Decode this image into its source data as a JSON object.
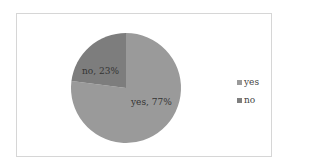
{
  "chart_data": {
    "type": "pie",
    "title": "",
    "categories": [
      "yes",
      "no"
    ],
    "values": [
      77,
      23
    ],
    "unit": "%",
    "data_labels": [
      "yes, 77%",
      "no, 23%"
    ],
    "colors": {
      "yes": "#9a9a9a",
      "no": "#7d7d7d"
    },
    "legend": {
      "position": "right",
      "entries": [
        "yes",
        "no"
      ]
    }
  },
  "labels": {
    "yes": "yes, 77%",
    "no": "no, 23%"
  },
  "legend": {
    "items": [
      {
        "label": "yes",
        "color": "#9a9a9a"
      },
      {
        "label": "no",
        "color": "#7d7d7d"
      }
    ]
  }
}
